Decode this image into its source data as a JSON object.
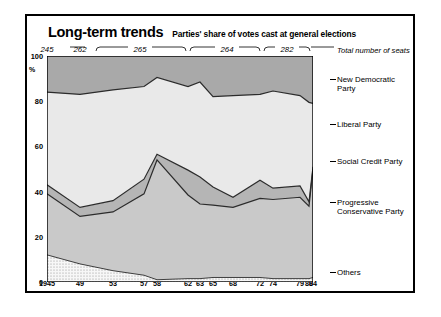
{
  "header": {
    "title": "Long-term trends",
    "subtitle": "Parties' share of votes cast at general elections",
    "seats_note": "Total number of seats"
  },
  "seat_groups": [
    {
      "label": "245",
      "x": 47,
      "bracket": false,
      "x0": 0,
      "x1": 0
    },
    {
      "label": "262",
      "x": 80,
      "bracket": false,
      "x0": 0,
      "x1": 0
    },
    {
      "label": "265",
      "x": 140,
      "bracket": true,
      "x0": 96,
      "x1": 186
    },
    {
      "label": "264",
      "x": 227,
      "bracket": true,
      "x0": 190,
      "x1": 260
    },
    {
      "label": "282",
      "x": 287,
      "bracket": true,
      "x0": 264,
      "x1": 310
    }
  ],
  "axis": {
    "y_label": "%",
    "y_ticks": [
      "100",
      "80",
      "60",
      "40",
      "20",
      "0"
    ],
    "y_values": [
      100,
      80,
      60,
      40,
      20,
      0
    ],
    "x_ticks": [
      {
        "label": "1945",
        "year": 1945
      },
      {
        "label": "49",
        "year": 1949
      },
      {
        "label": "53",
        "year": 1953
      },
      {
        "label": "57",
        "year": 1957
      },
      {
        "label": "58",
        "year": 1958
      },
      {
        "label": "62",
        "year": 1962
      },
      {
        "label": "63",
        "year": 1963
      },
      {
        "label": "65",
        "year": 1965
      },
      {
        "label": "68",
        "year": 1968
      },
      {
        "label": "72",
        "year": 1972
      },
      {
        "label": "74",
        "year": 1974
      },
      {
        "label": "79",
        "year": 1979
      },
      {
        "label": "80",
        "year": 1980
      },
      {
        "label": "84",
        "year": 1984
      }
    ]
  },
  "legend": [
    {
      "name": "New Democratic Party",
      "top": 75,
      "color": "#a8a8a8"
    },
    {
      "name": "Liberal Party",
      "top": 120,
      "color": "#e2e2e2"
    },
    {
      "name": "Social Credit Party",
      "top": 157,
      "color": "#b5b5b5"
    },
    {
      "name": "Progressive Conservative Party",
      "top": 198,
      "color": "#c9c9c9"
    },
    {
      "name": "Others",
      "top": 268,
      "color": "#f2f2f2"
    }
  ],
  "chart_data": {
    "type": "area",
    "title": "Long-term trends",
    "subtitle": "Parties' share of votes cast at general elections",
    "xlabel": "",
    "ylabel": "%",
    "ylim": [
      0,
      100
    ],
    "grid": false,
    "legend_position": "right",
    "stacked": true,
    "note": "Stacked 100% area chart of party vote share at Canadian general elections",
    "categories": [
      1945,
      1949,
      1953,
      1957,
      1958,
      1962,
      1963,
      1965,
      1968,
      1972,
      1974,
      1979,
      1980,
      1984
    ],
    "tick_labels": [
      "1945",
      "49",
      "53",
      "57",
      "58",
      "62",
      "63",
      "65",
      "68",
      "72",
      "74",
      "79",
      "80",
      "84"
    ],
    "total_seats": [
      245,
      262,
      265,
      265,
      265,
      265,
      265,
      265,
      264,
      264,
      264,
      282,
      282,
      282
    ],
    "series": [
      {
        "name": "Others",
        "color": "#f2f2f2",
        "values": [
          12,
          8,
          5,
          3,
          1,
          1.5,
          1.5,
          2,
          2,
          2,
          1.5,
          1.5,
          1.5,
          2
        ]
      },
      {
        "name": "Progressive Conservative Party",
        "color": "#c9c9c9",
        "values": [
          27,
          21,
          26,
          36,
          53,
          37,
          33,
          32,
          31,
          35,
          35,
          36,
          32,
          48
        ]
      },
      {
        "name": "Social Credit Party",
        "color": "#b5b5b5",
        "values": [
          4,
          4,
          5,
          6.5,
          2.5,
          11,
          12,
          8,
          4.5,
          8,
          5,
          5,
          2,
          1
        ]
      },
      {
        "name": "Liberal Party",
        "color": "#e2e2e2",
        "values": [
          41,
          50,
          49,
          41,
          34,
          37,
          42,
          40,
          45,
          38,
          43,
          40,
          44,
          28
        ]
      },
      {
        "name": "New Democratic Party",
        "color": "#a8a8a8",
        "values": [
          16,
          17,
          15,
          13.5,
          9.5,
          13.5,
          11.5,
          18,
          17.5,
          17,
          15.5,
          17.5,
          20.5,
          21
        ]
      }
    ],
    "boundaries_cumulative": {
      "others_top": [
        12,
        8,
        5,
        3,
        1,
        1.5,
        1.5,
        2,
        2,
        2,
        1.5,
        1.5,
        1.5,
        2
      ],
      "pc_top": [
        39,
        29,
        31,
        39,
        54,
        38.5,
        34.5,
        34,
        33,
        37,
        36.5,
        37.5,
        33.5,
        50
      ],
      "sc_top": [
        43,
        33,
        36,
        45.5,
        56.5,
        49.5,
        46.5,
        42,
        37.5,
        45,
        41.5,
        42.5,
        35.5,
        51
      ],
      "lib_top": [
        84,
        83,
        85,
        86.5,
        90.5,
        86.5,
        88.5,
        82,
        82.5,
        83,
        84.5,
        82.5,
        79.5,
        79
      ]
    }
  }
}
